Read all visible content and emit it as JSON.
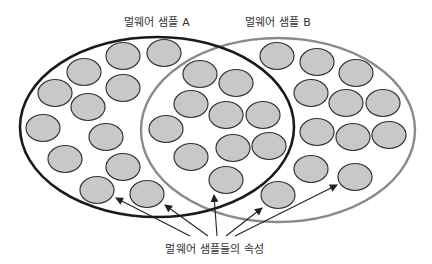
{
  "labels": {
    "set_a": "멀웨어 샘플 A",
    "set_b": "멀웨어 샘플 B",
    "attributes": "멀웨어 샘플들의 속성"
  },
  "colors": {
    "set_a_stroke": "#1a1a1a",
    "set_b_stroke": "#8a8a8a",
    "node_fill": "#c8c8c8",
    "node_stroke": "#333333",
    "arrow": "#222222"
  },
  "ellipses": [
    {
      "name": "set-a",
      "cx": 157,
      "cy": 127,
      "rx": 137,
      "ry": 90
    },
    {
      "name": "set-b",
      "cx": 278,
      "cy": 130,
      "rx": 137,
      "ry": 92
    }
  ],
  "nodes": [
    {
      "x": 123,
      "y": 56
    },
    {
      "x": 164,
      "y": 53
    },
    {
      "x": 84,
      "y": 72
    },
    {
      "x": 55,
      "y": 93
    },
    {
      "x": 123,
      "y": 88
    },
    {
      "x": 88,
      "y": 107
    },
    {
      "x": 43,
      "y": 128
    },
    {
      "x": 106,
      "y": 137
    },
    {
      "x": 65,
      "y": 159
    },
    {
      "x": 123,
      "y": 167
    },
    {
      "x": 97,
      "y": 190
    },
    {
      "x": 147,
      "y": 194
    },
    {
      "x": 200,
      "y": 74
    },
    {
      "x": 191,
      "y": 104
    },
    {
      "x": 166,
      "y": 129
    },
    {
      "x": 191,
      "y": 157
    },
    {
      "x": 236,
      "y": 83
    },
    {
      "x": 226,
      "y": 115
    },
    {
      "x": 263,
      "y": 115
    },
    {
      "x": 233,
      "y": 148
    },
    {
      "x": 269,
      "y": 146
    },
    {
      "x": 226,
      "y": 180
    },
    {
      "x": 277,
      "y": 56
    },
    {
      "x": 317,
      "y": 62
    },
    {
      "x": 356,
      "y": 73
    },
    {
      "x": 311,
      "y": 93
    },
    {
      "x": 346,
      "y": 103
    },
    {
      "x": 383,
      "y": 103
    },
    {
      "x": 317,
      "y": 132
    },
    {
      "x": 353,
      "y": 137
    },
    {
      "x": 389,
      "y": 135
    },
    {
      "x": 311,
      "y": 169
    },
    {
      "x": 355,
      "y": 177
    },
    {
      "x": 278,
      "y": 195
    }
  ],
  "arrows": [
    {
      "x1": 190,
      "y1": 236,
      "x2": 116,
      "y2": 198
    },
    {
      "x1": 208,
      "y1": 236,
      "x2": 165,
      "y2": 205
    },
    {
      "x1": 217,
      "y1": 236,
      "x2": 214,
      "y2": 195
    },
    {
      "x1": 226,
      "y1": 236,
      "x2": 262,
      "y2": 208
    },
    {
      "x1": 235,
      "y1": 236,
      "x2": 337,
      "y2": 185
    }
  ]
}
